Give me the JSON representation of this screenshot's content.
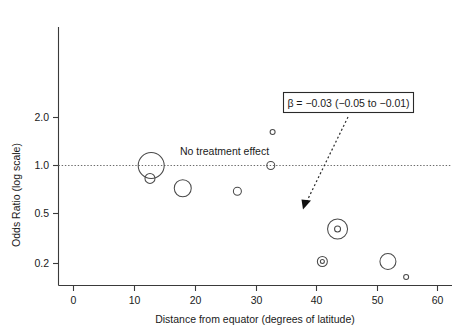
{
  "chart_data": {
    "type": "scatter",
    "title": "",
    "xlabel": "Distance from equator (degrees of latitude)",
    "ylabel": "Odds Ratio (log scale)",
    "xlim": [
      -3,
      63
    ],
    "ylim": [
      0.16,
      3.1
    ],
    "xticks": [
      0,
      10,
      20,
      30,
      40,
      50,
      60
    ],
    "xticklabels": [
      "0",
      "10",
      "20",
      "30",
      "40",
      "50",
      "60"
    ],
    "yticks": [
      2.0,
      1.0,
      0.5,
      0.2
    ],
    "yticklabels": [
      "2.0",
      "1.0",
      "0.5",
      "0.2"
    ],
    "yscale": "log",
    "grid": false,
    "legend": null,
    "reference_line": {
      "y": 1.0,
      "label": "No treatment effect",
      "style": "dotted"
    },
    "points": [
      {
        "x": 12.8,
        "y": 1.0,
        "size": 13.0
      },
      {
        "x": 12.6,
        "y": 0.83,
        "size": 5.0
      },
      {
        "x": 18.0,
        "y": 0.72,
        "size": 8.5
      },
      {
        "x": 27.0,
        "y": 0.69,
        "size": 4.0
      },
      {
        "x": 32.8,
        "y": 1.62,
        "size": 2.5
      },
      {
        "x": 32.5,
        "y": 1.0,
        "size": 4.0
      },
      {
        "x": 43.5,
        "y": 0.4,
        "size": 10.0
      },
      {
        "x": 43.5,
        "y": 0.4,
        "size": 3.0
      },
      {
        "x": 41.0,
        "y": 0.25,
        "size": 5.0
      },
      {
        "x": 41.0,
        "y": 0.25,
        "size": 2.0
      },
      {
        "x": 51.8,
        "y": 0.25,
        "size": 8.0
      },
      {
        "x": 54.8,
        "y": 0.2,
        "size": 2.5
      }
    ],
    "annotations": [
      {
        "name": "beta-annotation",
        "text": "β = −0.03 (−0.05 to −0.01)"
      },
      {
        "name": "reference-label",
        "text": "No treatment effect"
      }
    ]
  },
  "axes": {
    "y_title": "Odds Ratio (log scale)",
    "x_title": "Distance from equator (degrees of latitude)",
    "y_labels": [
      "2.0",
      "1.0",
      "0.5",
      "0.2"
    ],
    "x_labels": [
      "0",
      "10",
      "20",
      "30",
      "40",
      "50",
      "60"
    ]
  },
  "annotations": {
    "beta_text": "β = −0.03 (−0.05 to −0.01)",
    "no_effect_text": "No treatment effect"
  },
  "colors": {
    "bubble_stroke": "#4a4a4a",
    "axis": "#3a3a3a",
    "reference": "#6b6b6b",
    "box_border": "#2a2a2a",
    "background": "#ffffff"
  }
}
